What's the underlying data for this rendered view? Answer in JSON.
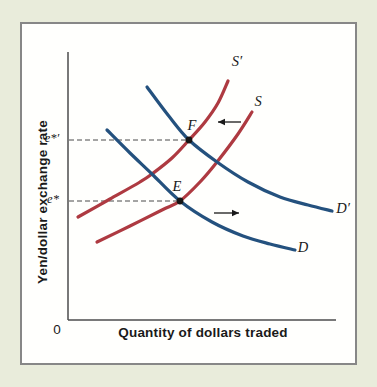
{
  "page": {
    "background": "#e9ecdb",
    "panel_border": "#878787",
    "panel_background": "#fffffd"
  },
  "chart_data": {
    "type": "line",
    "subtype": "supply-demand-diagram",
    "title": "",
    "xlabel": "Quantity of dollars traded",
    "ylabel": "Yen/dollar exchange rate",
    "origin_label": "0",
    "grid": false,
    "axes_numeric": false,
    "axis_color": "#4d4d4d",
    "x_axis_px": {
      "x1": 68,
      "y1": 320,
      "x2": 336,
      "y2": 320
    },
    "y_axis_px": {
      "x1": 68,
      "y1": 52,
      "x2": 68,
      "y2": 320
    },
    "supply_color": "#ae3a41",
    "demand_color": "#24517e",
    "point_color": "#151515",
    "dash_color": "#4a4a4a",
    "arrow_color": "#1a1a1a",
    "curves": [
      {
        "id": "s-prime",
        "label": "S′",
        "kind": "supply-shifted-left",
        "color": "#ae3a41",
        "points": [
          [
            78,
            217
          ],
          [
            110,
            199
          ],
          [
            140,
            182
          ],
          [
            152,
            174
          ],
          [
            172,
            158
          ],
          [
            189,
            140
          ],
          [
            205,
            122
          ],
          [
            218,
            103
          ],
          [
            228,
            81
          ]
        ],
        "label_x": 237,
        "label_y": 63
      },
      {
        "id": "s",
        "label": "S",
        "kind": "supply-original",
        "color": "#ae3a41",
        "points": [
          [
            97,
            242
          ],
          [
            130,
            226
          ],
          [
            162,
            210
          ],
          [
            180,
            201
          ],
          [
            200,
            182
          ],
          [
            217,
            162
          ],
          [
            238,
            134
          ],
          [
            252,
            112
          ]
        ],
        "label_x": 258,
        "label_y": 103
      },
      {
        "id": "d-prime",
        "label": "D′",
        "kind": "demand-shifted-right",
        "color": "#24517e",
        "points": [
          [
            147,
            87
          ],
          [
            168,
            115
          ],
          [
            189,
            140
          ],
          [
            217,
            162
          ],
          [
            248,
            182
          ],
          [
            280,
            197
          ],
          [
            308,
            205
          ],
          [
            332,
            211
          ]
        ],
        "label_x": 343,
        "label_y": 210
      },
      {
        "id": "d",
        "label": "D",
        "kind": "demand-original",
        "color": "#24517e",
        "points": [
          [
            107,
            130
          ],
          [
            130,
            153
          ],
          [
            152,
            174
          ],
          [
            180,
            201
          ],
          [
            212,
            222
          ],
          [
            243,
            236
          ],
          [
            270,
            244
          ],
          [
            295,
            250
          ]
        ],
        "label_x": 303,
        "label_y": 249
      }
    ],
    "equilibria": [
      {
        "id": "f",
        "label": "F",
        "x": 189,
        "y": 140,
        "label_x": 192,
        "label_y": 127,
        "rate_label": "e*′",
        "rate_label_x": 52,
        "rate_label_y": 139,
        "meaning": "new equilibrium of S′ and D′"
      },
      {
        "id": "e",
        "label": "E",
        "x": 180,
        "y": 201,
        "label_x": 177,
        "label_y": 188,
        "rate_label": "e*",
        "rate_label_x": 53,
        "rate_label_y": 200,
        "meaning": "original equilibrium of S and D"
      }
    ],
    "shift_arrows": [
      {
        "id": "supply-shift-arrow",
        "direction": "left",
        "x1": 241,
        "y1": 122,
        "x2": 218,
        "y2": 122
      },
      {
        "id": "demand-shift-arrow",
        "direction": "right",
        "x1": 214,
        "y1": 213,
        "x2": 239,
        "y2": 213
      }
    ]
  }
}
